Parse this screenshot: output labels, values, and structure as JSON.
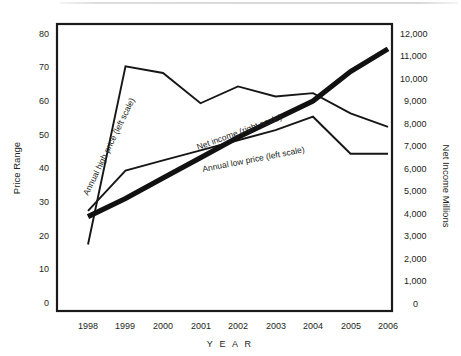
{
  "chart_data": {
    "type": "line",
    "title": "",
    "xlabel": "Y E A R",
    "categories": [
      "1998",
      "1999",
      "2000",
      "2001",
      "2002",
      "2003",
      "2004",
      "2005",
      "2006"
    ],
    "grid": false,
    "legend_position": "inline-labels",
    "axes": {
      "left": {
        "label": "Price Range",
        "ticks": [
          "0",
          "10",
          "20",
          "30",
          "40",
          "50",
          "60",
          "70",
          "80"
        ],
        "tick_values": [
          0,
          10,
          20,
          30,
          40,
          50,
          60,
          70,
          80
        ],
        "lim": [
          0,
          80
        ]
      },
      "right": {
        "label": "Net Income Millions",
        "ticks": [
          "0",
          "1,000",
          "2,000",
          "3,000",
          "4,000",
          "5,000",
          "6,000",
          "7,000",
          "8,000",
          "9,000",
          "10,000",
          "11,000",
          "12,000"
        ],
        "tick_values": [
          0,
          1000,
          2000,
          3000,
          4000,
          5000,
          6000,
          7000,
          8000,
          9000,
          10000,
          11000,
          12000
        ],
        "lim": [
          0,
          12000
        ]
      }
    },
    "series": [
      {
        "name": "Annual high price (left scale)",
        "label": "Annual high price (left scale)",
        "axis": "left",
        "style": "thin",
        "values": [
          18,
          71,
          69,
          60,
          65,
          62,
          63,
          57,
          53
        ]
      },
      {
        "name": "Annual low price (left scale)",
        "label": "Annual low price (left scale)",
        "axis": "left",
        "style": "thin",
        "values": [
          28,
          40,
          43,
          46,
          49,
          52,
          56,
          45,
          45
        ]
      },
      {
        "name": "Net income (right scale)",
        "label": "Net income (right scale)",
        "axis": "right",
        "style": "thick",
        "values": [
          3900,
          4700,
          5600,
          6500,
          7400,
          8200,
          9000,
          10300,
          11300
        ]
      }
    ]
  }
}
